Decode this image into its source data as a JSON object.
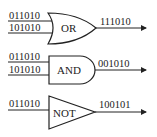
{
  "gates": [
    {
      "type": "OR",
      "label": "OR",
      "inputs": [
        "011010",
        "101010"
      ],
      "output": "111010"
    },
    {
      "type": "AND",
      "label": "AND",
      "inputs": [
        "011010",
        "101010"
      ],
      "output": "001010"
    },
    {
      "type": "NOT",
      "label": "NOT",
      "inputs": [
        "011010"
      ],
      "output": "100101"
    }
  ],
  "colors": {
    "stroke": "#222222",
    "background": "#ffffff"
  }
}
